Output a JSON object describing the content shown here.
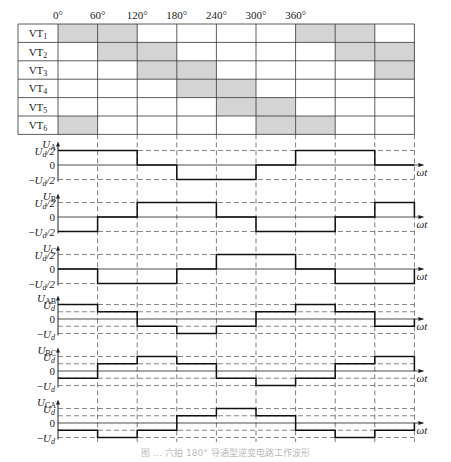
{
  "angles": [
    "0°",
    "60°",
    "120°",
    "180°",
    "240°",
    "300°",
    "360°"
  ],
  "switch_table": {
    "rows": [
      {
        "label": "VT",
        "sub": "1",
        "on": [
          0,
          1,
          6,
          7
        ]
      },
      {
        "label": "VT",
        "sub": "2",
        "on": [
          1,
          2,
          7,
          8
        ]
      },
      {
        "label": "VT",
        "sub": "3",
        "on": [
          2,
          3,
          8
        ]
      },
      {
        "label": "VT",
        "sub": "4",
        "on": [
          3,
          4
        ]
      },
      {
        "label": "VT",
        "sub": "5",
        "on": [
          4,
          5
        ]
      },
      {
        "label": "VT",
        "sub": "6",
        "on": [
          0,
          5,
          6
        ]
      }
    ],
    "shade_color": "#d4d4d4"
  },
  "waveforms": [
    {
      "name": "U",
      "sub": "A",
      "levels": [
        "Ud/2",
        "0",
        "−Ud/2"
      ],
      "steps": [
        0.5,
        0.5,
        0,
        -0.5,
        -0.5,
        0,
        0.5,
        0.5,
        0
      ]
    },
    {
      "name": "U",
      "sub": "B",
      "levels": [
        "Ud/2",
        "0",
        "−Ud/2"
      ],
      "steps": [
        -0.5,
        0,
        0.5,
        0.5,
        0,
        -0.5,
        -0.5,
        0,
        0.5
      ]
    },
    {
      "name": "U",
      "sub": "C",
      "levels": [
        "Ud/2",
        "0",
        "−Ud/2"
      ],
      "steps": [
        0,
        -0.5,
        -0.5,
        0,
        0.5,
        0.5,
        0,
        -0.5,
        -0.5
      ]
    },
    {
      "name": "U",
      "sub": "AB",
      "levels": [
        "Ud",
        "0",
        "−Ud"
      ],
      "steps": [
        1,
        0.5,
        -0.5,
        -1,
        -0.5,
        0.5,
        1,
        0.5,
        -0.5
      ]
    },
    {
      "name": "U",
      "sub": "BC",
      "levels": [
        "Ud",
        "0",
        "−Ud"
      ],
      "steps": [
        -0.5,
        0.5,
        1,
        0.5,
        -0.5,
        -1,
        -0.5,
        0.5,
        1
      ]
    },
    {
      "name": "U",
      "sub": "CA",
      "levels": [
        "Ud",
        "0",
        "−Ud"
      ],
      "steps": [
        -0.5,
        -1,
        -0.5,
        0.5,
        1,
        0.5,
        -0.5,
        -1,
        -0.5
      ]
    }
  ],
  "axis_label": "ωt",
  "caption": "图 … 六拍 180° 导通型逆变电路工作波形"
}
